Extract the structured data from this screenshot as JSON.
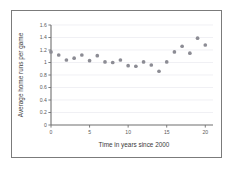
{
  "figure": {
    "border_color": "#7b7b7b",
    "background": "#ffffff",
    "top_remnant_text": "",
    "top_remnant_mark": ""
  },
  "chart_data": {
    "type": "scatter",
    "title": "",
    "xlabel": "Time in years since 2000",
    "ylabel": "Average home runs per game",
    "xlim": [
      0,
      21
    ],
    "ylim": [
      0,
      1.6
    ],
    "grid": true,
    "legend": null,
    "point_color": "#8c8c94",
    "axis_color": "#6f6f6f",
    "gridline_color": "#e9e9ef",
    "xticks": [
      0,
      5,
      10,
      15,
      20
    ],
    "xtick_labels": [
      "0",
      "5",
      "10",
      "15",
      "20"
    ],
    "yticks": [
      0,
      0.2,
      0.4,
      0.6,
      0.8,
      1,
      1.2,
      1.4,
      1.6
    ],
    "ytick_labels": [
      "0",
      "0.2",
      "0.4",
      "0.6",
      "0.8",
      "1",
      "1.2",
      "1.4",
      "1.6"
    ],
    "x": [
      0,
      1,
      2,
      3,
      4,
      5,
      6,
      7,
      8,
      9,
      10,
      11,
      12,
      13,
      14,
      15,
      16,
      17,
      18,
      19,
      20
    ],
    "values": [
      1.17,
      1.12,
      1.04,
      1.07,
      1.12,
      1.03,
      1.11,
      1.01,
      1.0,
      1.04,
      0.95,
      0.94,
      1.01,
      0.96,
      0.86,
      1.01,
      1.17,
      1.26,
      1.15,
      1.39,
      1.28
    ]
  }
}
